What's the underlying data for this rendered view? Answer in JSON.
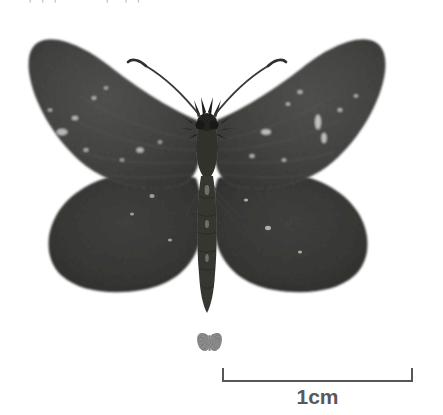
{
  "plate": {
    "background_color": "#ffffff",
    "width": 443,
    "height": 415
  },
  "caption_remnant": {
    "text": "|·|·| · — ·|· |·| · | ··",
    "color": "#b9b9bd",
    "note_visible": "cropped top edge of a text line; glyph bottoms only"
  },
  "specimen": {
    "label": "pinned lepidopteran specimen, dorsal view, wings spread",
    "forewing_color": "#4a4a48",
    "hindwing_color": "#3a3a38",
    "body_color": "#2e2e2c",
    "antenna_color": "#353533",
    "speckle_color": "#e8e8e6"
  },
  "thumbnail_icon": {
    "name": "butterfly-silhouette",
    "color": "#9a9a9c"
  },
  "scale_bar": {
    "label": "1cm",
    "color": "#55555a",
    "length_px": 191,
    "represents": "1 cm"
  }
}
